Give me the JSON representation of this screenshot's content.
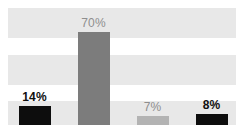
{
  "chart_data": {
    "type": "bar",
    "title": "",
    "subtitle": "",
    "xlabel": "",
    "ylabel": "",
    "ylim": [
      0,
      75
    ],
    "grid": true,
    "grid_style": "alternating-horizontal-bands",
    "legend": "none",
    "categories": [
      "",
      "",
      "",
      ""
    ],
    "values": [
      14,
      70,
      7,
      8
    ],
    "value_labels": [
      "14%",
      "70%",
      "7%",
      "8%"
    ],
    "series": [
      {
        "name": "",
        "values": [
          14,
          70,
          7,
          8
        ],
        "labels": [
          "14%",
          "70%",
          "7%",
          "8%"
        ],
        "colors": [
          "#0d0d0d",
          "#7c7c7c",
          "#b3b3b3",
          "#0d0d0d"
        ],
        "label_colors": [
          "#101010",
          "#8e8e8e",
          "#8e8e8e",
          "#101010"
        ],
        "label_weights": [
          "bold",
          "normal",
          "normal",
          "bold"
        ]
      }
    ]
  },
  "figure": {
    "background": "#ffffff",
    "band_color": "#e8e8e8",
    "bands": 3
  },
  "bars": [
    {
      "label": "14%",
      "value": 14,
      "color": "#0d0d0d",
      "emphasis": "emph"
    },
    {
      "label": "70%",
      "value": 70,
      "color": "#7c7c7c",
      "emphasis": "mute"
    },
    {
      "label": "7%",
      "value": 7,
      "color": "#b3b3b3",
      "emphasis": "mute"
    },
    {
      "label": "8%",
      "value": 8,
      "color": "#0d0d0d",
      "emphasis": "emph"
    }
  ],
  "axis": {
    "categories": [
      "",
      "",
      "",
      ""
    ]
  }
}
